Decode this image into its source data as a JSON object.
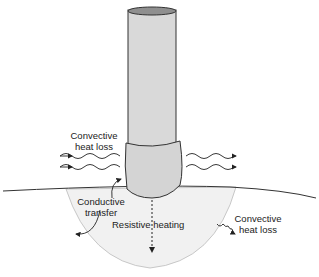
{
  "diagram": {
    "type": "electrode heat transfer schematic",
    "labels": {
      "convective_top_left": [
        "Convective",
        "heat loss"
      ],
      "conductive": [
        "Conductive",
        "transfer"
      ],
      "resistive": "Resistive heating",
      "convective_bottom_right": [
        "Convective",
        "heat loss"
      ]
    },
    "colors": {
      "electrode_fill": "#d9d9d9",
      "electrode_top": "#8f8f8f",
      "tip_fill": "#d4d4d4",
      "tissue_zone": "#f1f1f1",
      "stroke": "#222222"
    }
  }
}
